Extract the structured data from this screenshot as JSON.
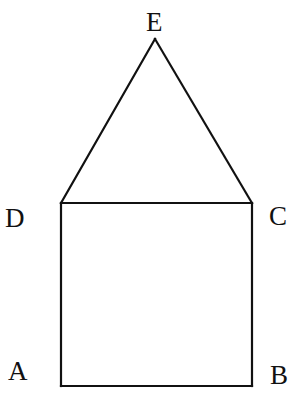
{
  "diagram": {
    "type": "house-shape (square ABCD with triangle DCE on top)",
    "colors": {
      "line": "#111111",
      "background": "#ffffff"
    },
    "points": {
      "A": {
        "label": "A",
        "x": 61,
        "y": 386
      },
      "B": {
        "label": "B",
        "x": 252,
        "y": 386
      },
      "C": {
        "label": "C",
        "x": 252,
        "y": 203
      },
      "D": {
        "label": "D",
        "x": 61,
        "y": 203
      },
      "E": {
        "label": "E",
        "x": 155,
        "y": 39
      }
    },
    "segments": [
      "AB",
      "BC",
      "CD",
      "DA",
      "DE",
      "EC"
    ],
    "labels": {
      "A": "A",
      "B": "B",
      "C": "C",
      "D": "D",
      "E": "E"
    }
  }
}
